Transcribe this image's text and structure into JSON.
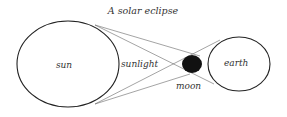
{
  "title": "A solar eclipse",
  "labels": {
    "sun": "sun",
    "sunlight": "sunlight",
    "moon": "moon",
    "earth": "earth"
  },
  "colors": {
    "stroke": "#222222",
    "moon_fill": "#111111",
    "text": "#333333"
  }
}
